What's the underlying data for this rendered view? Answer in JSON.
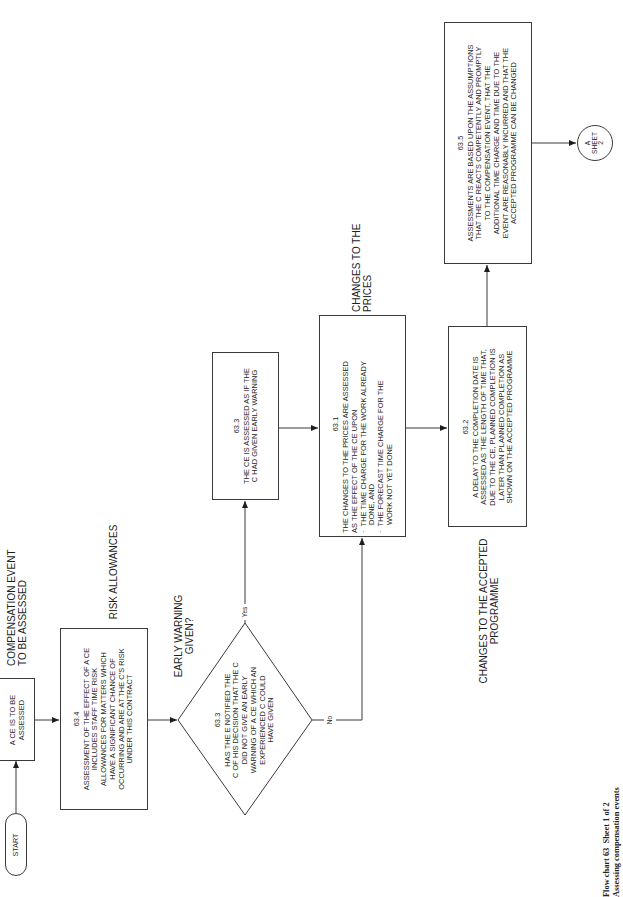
{
  "diagram": {
    "title": "Flow chart 63  Sheet 1 of 2",
    "subtitle": "Assessing compensation events",
    "start": {
      "label": "START"
    },
    "nodes": {
      "ce_to_be_assessed": {
        "text": "A CE IS TO BE ASSESSED",
        "lines": [
          "A CE IS TO BE",
          "ASSESSED"
        ]
      },
      "n63_4": {
        "number": "63.4",
        "lines": [
          "ASSESSMENT OF THE EFFECT OF A CE",
          "INCLUDES STAFF TIME RISK",
          "ALLOWANCES FOR MATTERS WHICH",
          "HAVE A SIGNIFICANT CHANCE OF",
          "OCCURRING AND ARE AT THE C'S RISK",
          "UNDER THIS CONTRACT"
        ]
      },
      "decision_63_3": {
        "number": "63.3",
        "lines": [
          "HAS THE E NOTIFIED THE",
          "C OF HIS DECISION THAT THE C",
          "DID NOT GIVE AN EARLY",
          "WARNING OF A CE WHICH AN",
          "EXPERIENCED C COULD",
          "HAVE GIVEN"
        ],
        "yes_label": "Yes",
        "no_label": "No"
      },
      "n63_3": {
        "number": "63.3",
        "lines": [
          "THE CE IS ASSESSED AS IF THE",
          "C HAD GIVEN EARLY WARNING"
        ]
      },
      "n63_1": {
        "number": "63.1",
        "lines": [
          "THE CHANGES TO THE PRICES ARE ASSESSED",
          "AS THE EFFECT OF THE CE UPON"
        ],
        "bullets": [
          [
            "THE TIME CHARGE FOR THE WORK ALREADY",
            "DONE, AND"
          ],
          [
            "THE FORECAST TIME CHARGE FOR THE",
            "WORK NOT YET DONE"
          ]
        ],
        "bullet_char": "·"
      },
      "n63_2": {
        "number": "63.2",
        "lines": [
          "A DELAY TO THE COMPLETION DATE IS",
          "ASSESSED AS THE LENGTH OF TIME THAT,",
          "DUE TO THE CE, PLANNED COMPLETION IS",
          "LATER THAN PLANNED COMPLETION AS",
          "SHOWN ON THE ACCEPTED PROGRAMME"
        ]
      },
      "n63_5": {
        "number": "63.5",
        "lines": [
          "ASSESSMENTS ARE BASED UPON THE ASSUMPTIONS",
          "THAT THE C REACTS COMPETENTLY AND PROMPTLY",
          "TO THE COMPENSATION EVENT, THAT THE",
          "ADDITIONAL TIME CHARGE AND TIME DUE TO THE",
          "EVENT ARE REASONABLY INCURRED AND THAT THE",
          "ACCEPTED PROGRAMME CAN BE CHANGED"
        ]
      },
      "connector": {
        "lines": [
          "A",
          "SHEET",
          "2"
        ]
      }
    },
    "annotations": {
      "compensation_event": [
        "COMPENSATION EVENT",
        "TO BE ASSESSED"
      ],
      "risk_allowances": [
        "RISK ALLOWANCES"
      ],
      "early_warning": [
        "EARLY WARNING",
        "GIVEN?"
      ],
      "changes_prices": [
        "CHANGES TO THE",
        "PRICES"
      ],
      "changes_programme": [
        "CHANGES TO THE ACCEPTED",
        "PROGRAMME"
      ]
    },
    "colors": {
      "line": "#3a3a3a",
      "text": "#1e1e1e",
      "background": "#ffffff"
    }
  }
}
